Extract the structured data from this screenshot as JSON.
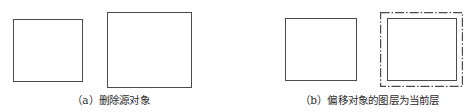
{
  "figures": [
    {
      "id": "a",
      "caption": "（a）删除源对象",
      "shapes": [
        {
          "type": "rectangle",
          "style": "solid",
          "label": "remaining-rectangle-small",
          "x": 13,
          "y": 19,
          "w": 70,
          "h": 63
        },
        {
          "type": "rectangle",
          "style": "solid",
          "label": "offset-rectangle-large",
          "x": 107,
          "y": 12,
          "w": 85,
          "h": 76
        }
      ]
    },
    {
      "id": "b",
      "caption": "（b）偏移对象的图层为当前层",
      "shapes": [
        {
          "type": "rectangle",
          "style": "solid",
          "label": "source-rectangle",
          "x": 285,
          "y": 18,
          "w": 72,
          "h": 63
        },
        {
          "type": "rectangle",
          "style": "solid",
          "label": "inner-rectangle",
          "x": 387,
          "y": 18,
          "w": 70,
          "h": 63
        },
        {
          "type": "rectangle",
          "style": "dash-dot",
          "label": "offset-rectangle-current-layer",
          "x": 380,
          "y": 12,
          "w": 83,
          "h": 75
        }
      ]
    }
  ],
  "colors": {
    "line": "#4a4a4a",
    "text": "#2c2c2c",
    "background": "#ffffff"
  }
}
